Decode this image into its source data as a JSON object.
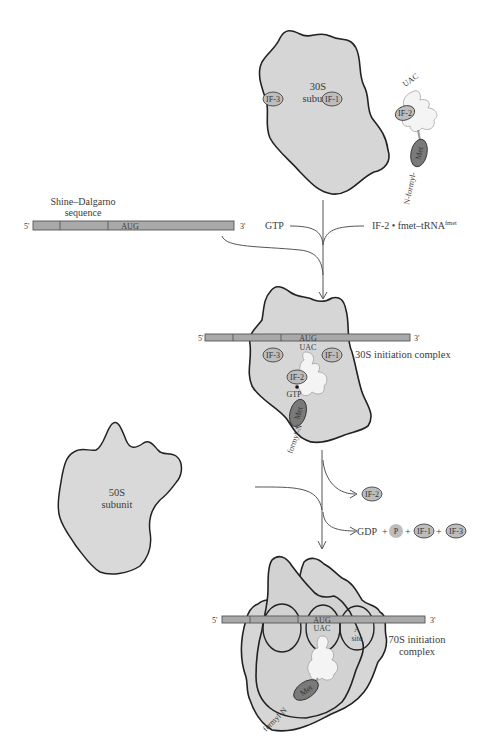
{
  "diagram": {
    "type": "process-flow",
    "colors": {
      "subunit_fill": "#d6d6d6",
      "mrna_fill": "#a9a9a9",
      "factor_fill": "#bdbdbd",
      "met_fill": "#7a7a7a",
      "trna_fill": "#f4f4f4",
      "outline": "#222222"
    },
    "subunit_30s": {
      "label_line1": "30S",
      "label_line2": "subunit",
      "factors": [
        "IF-3",
        "IF-1"
      ]
    },
    "trna_complex": {
      "anticodon": "UAC",
      "factor": "IF-2",
      "amino_acid": "Met",
      "n_term_label": "N-formyl-"
    },
    "mrna": {
      "five_prime": "5'",
      "three_prime": "3'",
      "start_codon": "AUG",
      "sd_label_line1": "Shine–Dalgarno",
      "sd_label_line2": "sequence"
    },
    "inputs": {
      "gtp": "GTP",
      "if2_complex": "IF-2 • fmet–tRNA",
      "if2_superscript": "fmet"
    },
    "complex_30s": {
      "label": "30S initiation complex",
      "codon": "AUG",
      "anticodon": "UAC",
      "factors": [
        "IF-3",
        "IF-1",
        "IF-2"
      ],
      "gtp": "GTP",
      "amino_acid": "Met",
      "n_term_label": "formyl-N"
    },
    "subunit_50s": {
      "label_line1": "50S",
      "label_line2": "subunit"
    },
    "released": {
      "if2": "IF-2",
      "gdp": "GDP",
      "plus": "+",
      "phosphate": "P",
      "if1": "IF-1",
      "if3": "IF-3"
    },
    "complex_70s": {
      "label_line1": "70S initiation",
      "label_line2": "complex",
      "codon": "AUG",
      "anticodon": "UAC",
      "a_site_line1": "A",
      "a_site_line2": "site",
      "amino_acid": "Met",
      "n_term_label": "formyl-N"
    }
  }
}
